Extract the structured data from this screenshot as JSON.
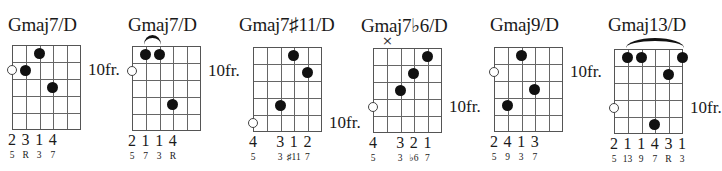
{
  "grid": {
    "string_gap": 13.6,
    "fret_gap": 16.8,
    "strings": 6,
    "frets": 5
  },
  "chords": [
    {
      "name": "Gmaj7/D",
      "grid_x": 12,
      "grid_y": 45,
      "title_x": 8,
      "title_y": 14,
      "fret_label": "10fr.",
      "fret_label_row": 2,
      "open": [
        {
          "string": 0,
          "row": 2
        }
      ],
      "muted": [],
      "barre": null,
      "dots": [
        {
          "string": 1,
          "row": 2
        },
        {
          "string": 2,
          "row": 1
        },
        {
          "string": 3,
          "row": 3
        }
      ],
      "fingers": [
        {
          "string": 0,
          "label": "2"
        },
        {
          "string": 1,
          "label": "3"
        },
        {
          "string": 2,
          "label": "1"
        },
        {
          "string": 3,
          "label": "4"
        }
      ],
      "intervals": [
        {
          "string": 0,
          "label": "5"
        },
        {
          "string": 1,
          "label": "R"
        },
        {
          "string": 2,
          "label": "3"
        },
        {
          "string": 3,
          "label": "7"
        }
      ]
    },
    {
      "name": "Gmaj7/D",
      "grid_x": 132,
      "grid_y": 46,
      "title_x": 128,
      "title_y": 14,
      "fret_label": "10fr.",
      "fret_label_row": 2,
      "open": [
        {
          "string": 0,
          "row": 2
        }
      ],
      "muted": [],
      "barre": {
        "from": 1,
        "to": 2
      },
      "dots": [
        {
          "string": 1,
          "row": 1
        },
        {
          "string": 2,
          "row": 1
        },
        {
          "string": 3,
          "row": 4
        }
      ],
      "fingers": [
        {
          "string": 0,
          "label": "2"
        },
        {
          "string": 1,
          "label": "1"
        },
        {
          "string": 2,
          "label": "1"
        },
        {
          "string": 3,
          "label": "4"
        }
      ],
      "intervals": [
        {
          "string": 0,
          "label": "5"
        },
        {
          "string": 1,
          "label": "7"
        },
        {
          "string": 2,
          "label": "3"
        },
        {
          "string": 3,
          "label": "R"
        }
      ]
    },
    {
      "name": "Gmaj7♯11/D",
      "grid_x": 253,
      "grid_y": 47,
      "title_x": 239,
      "title_y": 14,
      "fret_label": "10fr.",
      "fret_label_row": 5,
      "open": [
        {
          "string": 0,
          "row": 5
        }
      ],
      "muted": [],
      "barre": null,
      "dots": [
        {
          "string": 3,
          "row": 1
        },
        {
          "string": 4,
          "row": 2
        },
        {
          "string": 2,
          "row": 4
        }
      ],
      "fingers": [
        {
          "string": 0,
          "label": "4"
        },
        {
          "string": 2,
          "label": "3"
        },
        {
          "string": 3,
          "label": "1"
        },
        {
          "string": 4,
          "label": "2"
        }
      ],
      "intervals": [
        {
          "string": 0,
          "label": "5"
        },
        {
          "string": 2,
          "label": "3"
        },
        {
          "string": 3,
          "label": "♯11"
        },
        {
          "string": 4,
          "label": "7"
        }
      ]
    },
    {
      "name": "Gmaj7♭6/D",
      "grid_x": 373,
      "grid_y": 48,
      "title_x": 361,
      "title_y": 14,
      "fret_label": "10fr.",
      "fret_label_row": 4,
      "open": [
        {
          "string": 0,
          "row": 4
        }
      ],
      "muted": [
        {
          "string": 1,
          "symbol": "×"
        }
      ],
      "barre": null,
      "dots": [
        {
          "string": 4,
          "row": 1
        },
        {
          "string": 3,
          "row": 2
        },
        {
          "string": 2,
          "row": 3
        }
      ],
      "fingers": [
        {
          "string": 0,
          "label": "4"
        },
        {
          "string": 2,
          "label": "3"
        },
        {
          "string": 3,
          "label": "2"
        },
        {
          "string": 4,
          "label": "1"
        }
      ],
      "intervals": [
        {
          "string": 0,
          "label": "5"
        },
        {
          "string": 2,
          "label": "3"
        },
        {
          "string": 3,
          "label": "♭6"
        },
        {
          "string": 4,
          "label": "7"
        }
      ]
    },
    {
      "name": "Gmaj9/D",
      "grid_x": 494,
      "grid_y": 47,
      "title_x": 490,
      "title_y": 14,
      "fret_label": "10fr.",
      "fret_label_row": 2,
      "open": [
        {
          "string": 0,
          "row": 2
        }
      ],
      "muted": [],
      "barre": null,
      "dots": [
        {
          "string": 2,
          "row": 1
        },
        {
          "string": 3,
          "row": 3
        },
        {
          "string": 1,
          "row": 4
        }
      ],
      "fingers": [
        {
          "string": 0,
          "label": "2"
        },
        {
          "string": 1,
          "label": "4"
        },
        {
          "string": 2,
          "label": "1"
        },
        {
          "string": 3,
          "label": "3"
        }
      ],
      "intervals": [
        {
          "string": 0,
          "label": "5"
        },
        {
          "string": 1,
          "label": "9"
        },
        {
          "string": 2,
          "label": "3"
        },
        {
          "string": 3,
          "label": "7"
        }
      ]
    },
    {
      "name": "Gmaj13/D",
      "grid_x": 614,
      "grid_y": 49,
      "title_x": 608,
      "title_y": 14,
      "fret_label": "10fr.",
      "fret_label_row": 4,
      "open": [
        {
          "string": 0,
          "row": 4
        }
      ],
      "muted": [],
      "barre": {
        "from": 1,
        "to": 5
      },
      "dots": [
        {
          "string": 1,
          "row": 1
        },
        {
          "string": 2,
          "row": 1
        },
        {
          "string": 5,
          "row": 1
        },
        {
          "string": 4,
          "row": 2
        },
        {
          "string": 3,
          "row": 5
        }
      ],
      "fingers": [
        {
          "string": 0,
          "label": "2"
        },
        {
          "string": 1,
          "label": "1"
        },
        {
          "string": 2,
          "label": "1"
        },
        {
          "string": 3,
          "label": "4"
        },
        {
          "string": 4,
          "label": "3"
        },
        {
          "string": 5,
          "label": "1"
        }
      ],
      "intervals": [
        {
          "string": 0,
          "label": "5"
        },
        {
          "string": 1,
          "label": "13"
        },
        {
          "string": 2,
          "label": "9"
        },
        {
          "string": 3,
          "label": "7"
        },
        {
          "string": 4,
          "label": "R"
        },
        {
          "string": 5,
          "label": "3"
        }
      ]
    }
  ]
}
